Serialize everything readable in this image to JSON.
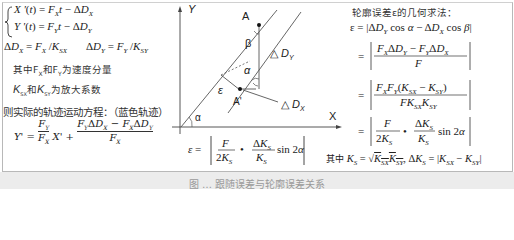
{
  "left_panel": {
    "eq1": "X'(t) = F_X t − ΔD_X",
    "eq2": "Y'(t) = F_Y t − ΔD_Y",
    "eq3a": "ΔD_X = F_X / K_SX",
    "eq3b": "ΔD_Y = F_Y / K_SY",
    "note1": "其中F_X和F_Y为速度分量",
    "note2": "K_SX和K_SY为放大系数",
    "trajectory_title": "则实际的轨迹运动方程：（蓝色轨迹）",
    "trajectory_eq": "Y' = (F_Y/F_X) X' + (F_Y ΔD_X − F_X ΔD_Y)/F_X"
  },
  "diagram": {
    "axis_y": "Y",
    "axis_x": "X",
    "point_a": "A",
    "point_a_prime": "A'",
    "angle_beta": "β",
    "angle_alpha_inner": "α",
    "angle_alpha_origin": "α",
    "epsilon": "ε",
    "delta_dy": "△ D_Y",
    "delta_dx": "△ D_X",
    "formula": "ε = | F/(2K_S) • ΔK_S/K_S sin 2α |"
  },
  "right_panel": {
    "title": "轮廓误差ε的几何求法：",
    "step1": "ε = |ΔD_Y cos α − ΔD_X cos β|",
    "step2": "= |(F_X ΔD_Y − F_Y ΔD_X)/F|",
    "step3": "= |F_X F_Y (K_SX − K_SY)/(F K_SX K_SY)|",
    "step4": "= |F/(2K_S) • ΔK_S/K_S sin 2α|",
    "where": "其中 K_S = √(K_SX K_SY), ΔK_S = |K_SX − K_SY|"
  },
  "caption": "图 … 跟随误差与轮廓误差关系"
}
